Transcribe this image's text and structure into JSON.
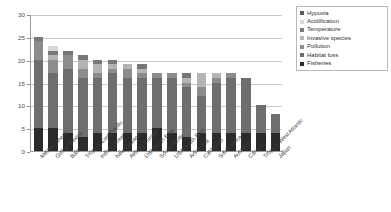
{
  "chart_data": {
    "type": "bar",
    "stacked": true,
    "title": "",
    "xlabel": "",
    "ylabel": "",
    "ylim": [
      0,
      30
    ],
    "yticks": [
      0,
      5,
      10,
      15,
      20,
      25,
      30
    ],
    "grid": true,
    "legend_position": "top-right",
    "categories": [
      "Mediterranean",
      "Gulf of Mexico",
      "Baltic",
      "Tropical East Pacific",
      "Indian Ocean",
      "New Zealand",
      "Atlantic Europe",
      "USA North East",
      "South Pacific",
      "USA South East",
      "Antarctica",
      "Caribbean",
      "South Africa",
      "Australia",
      "Canada",
      "Tropical West Atlantic",
      "Japan"
    ],
    "series": [
      {
        "name": "Fisheries",
        "color": "#2b2b2b",
        "values": [
          5,
          5,
          4,
          3,
          4,
          4,
          4,
          4,
          5,
          4,
          3,
          4,
          4,
          4,
          4,
          4,
          4
        ]
      },
      {
        "name": "Habitat loss",
        "color": "#6e6e6e",
        "values": [
          15,
          12,
          14,
          13,
          12,
          13,
          12,
          12,
          11,
          12,
          11,
          8,
          11,
          12,
          12,
          6,
          4
        ]
      },
      {
        "name": "Pollution",
        "color": "#8c8c8c",
        "values": [
          4,
          3,
          3,
          2,
          1,
          1,
          2,
          1,
          1,
          1,
          1,
          2,
          1,
          1,
          0,
          0,
          0
        ]
      },
      {
        "name": "Invasive species",
        "color": "#b4b4b4",
        "values": [
          0,
          1,
          0,
          2,
          2,
          1,
          1,
          1,
          0,
          0,
          1,
          3,
          1,
          0,
          0,
          0,
          0
        ]
      },
      {
        "name": "Temperature",
        "color": "#787878",
        "values": [
          1,
          1,
          1,
          1,
          1,
          1,
          0,
          1,
          0,
          0,
          1,
          0,
          0,
          0,
          0,
          0,
          0
        ]
      },
      {
        "name": "Acidification",
        "color": "#d8d8d8",
        "values": [
          0,
          1,
          0,
          0,
          0,
          0,
          0,
          0,
          0,
          0,
          0,
          0,
          0,
          0,
          0,
          0,
          0
        ]
      },
      {
        "name": "Hypoxia",
        "color": "#5a5a5a",
        "values": [
          0,
          0,
          0,
          0,
          0,
          0,
          0,
          0,
          0,
          0,
          0,
          0,
          0,
          0,
          0,
          0,
          0
        ]
      }
    ],
    "totals": [
      25,
      23,
      22,
      21,
      20,
      20,
      19,
      19,
      17,
      17,
      17,
      17,
      17,
      17,
      16,
      10,
      8
    ]
  },
  "legend": {
    "items": [
      {
        "label": "Hypoxia",
        "color": "#5a5a5a"
      },
      {
        "label": "Acidification",
        "color": "#d8d8d8"
      },
      {
        "label": "Temperature",
        "color": "#787878"
      },
      {
        "label": "Invasive species",
        "color": "#b4b4b4"
      },
      {
        "label": "Pollution",
        "color": "#8c8c8c"
      },
      {
        "label": "Habitat loss",
        "color": "#6e6e6e"
      },
      {
        "label": "Fisheries",
        "color": "#2b2b2b"
      }
    ]
  },
  "axes": {
    "y_tick_labels": [
      "0",
      "5",
      "10",
      "15",
      "20",
      "25",
      "30"
    ]
  }
}
